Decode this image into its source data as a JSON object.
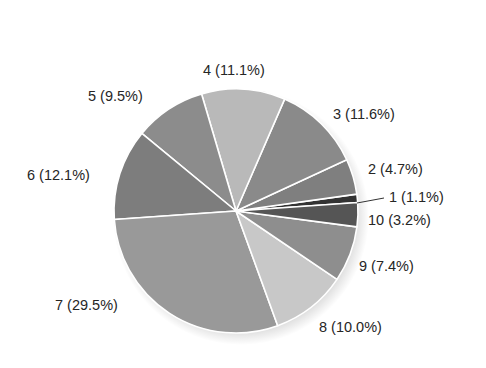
{
  "chart_data": {
    "type": "pie",
    "title": "",
    "categories": [
      "1",
      "2",
      "3",
      "4",
      "5",
      "6",
      "7",
      "8",
      "9",
      "10"
    ],
    "values": [
      1.1,
      4.7,
      11.6,
      11.1,
      9.5,
      12.1,
      29.5,
      10.0,
      7.4,
      3.2
    ],
    "unit": "%",
    "labels": [
      "1 (1.1%)",
      "2 (4.7%)",
      "3 (11.6%)",
      "4 (11.1%)",
      "5 (9.5%)",
      "6 (12.1%)",
      "7 (29.5%)",
      "8 (10.0%)",
      "9 (7.4%)",
      "10 (3.2%)"
    ],
    "colors": [
      "#333333",
      "#7f7f7f",
      "#8a8a8a",
      "#b9b9b9",
      "#8c8c8c",
      "#7d7d7d",
      "#999999",
      "#c8c8c8",
      "#8e8e8e",
      "#555555"
    ],
    "start_angle_deg": 4,
    "direction": "counterclockwise",
    "legend": "none",
    "grid": false
  },
  "layout": {
    "center": [
      236,
      211
    ],
    "radius": 122,
    "label_positions": [
      {
        "x": 389,
        "y": 202,
        "leader": [
          [
            357,
            203
          ],
          [
            384,
            198
          ]
        ]
      },
      {
        "x": 368,
        "y": 174
      },
      {
        "x": 333,
        "y": 119
      },
      {
        "x": 203,
        "y": 75
      },
      {
        "x": 88,
        "y": 101
      },
      {
        "x": 27,
        "y": 180
      },
      {
        "x": 55,
        "y": 310
      },
      {
        "x": 319,
        "y": 332
      },
      {
        "x": 359,
        "y": 271
      },
      {
        "x": 368,
        "y": 225
      }
    ]
  }
}
